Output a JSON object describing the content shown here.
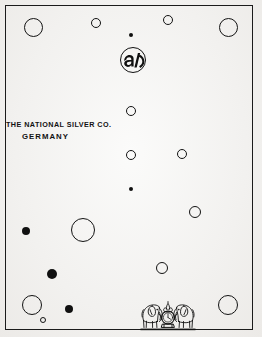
{
  "plate": {
    "background_color": "#f2f1ef",
    "ink_color": "#121212",
    "frame": {
      "stroke_color": "#1b1b1b",
      "x": 5,
      "y": 5,
      "width": 248,
      "height": 325
    }
  },
  "caption": {
    "line1": "THE NATIONAL SILVER CO.",
    "line2": "GERMANY",
    "x": 6,
    "y": 120
  },
  "monogram": {
    "label": "maker-monogram-roundel",
    "cx": 133,
    "cy": 60,
    "r": 13
  },
  "crest": {
    "label": "twin-elephants-crest",
    "x": 140,
    "y": 290,
    "width": 56,
    "height": 45
  },
  "marks": [
    {
      "id": "mark-1",
      "style": "open",
      "cx": 33,
      "cy": 27,
      "r": 9.5
    },
    {
      "id": "mark-2",
      "style": "open",
      "cx": 96,
      "cy": 23,
      "r": 5.0
    },
    {
      "id": "mark-3",
      "style": "filled",
      "cx": 131,
      "cy": 35,
      "r": 2.2
    },
    {
      "id": "mark-4",
      "style": "open",
      "cx": 168,
      "cy": 20,
      "r": 5.0
    },
    {
      "id": "mark-5",
      "style": "open",
      "cx": 228,
      "cy": 27,
      "r": 9.5
    },
    {
      "id": "mark-6",
      "style": "open",
      "cx": 131,
      "cy": 111,
      "r": 5.2
    },
    {
      "id": "mark-7",
      "style": "open",
      "cx": 131,
      "cy": 155,
      "r": 5.2
    },
    {
      "id": "mark-8",
      "style": "open",
      "cx": 182,
      "cy": 154,
      "r": 5.2
    },
    {
      "id": "mark-9",
      "style": "filled",
      "cx": 131,
      "cy": 189,
      "r": 2.2
    },
    {
      "id": "mark-10",
      "style": "open",
      "cx": 195,
      "cy": 212,
      "r": 6.0
    },
    {
      "id": "mark-11",
      "style": "filled",
      "cx": 26,
      "cy": 231,
      "r": 4.3
    },
    {
      "id": "mark-12",
      "style": "open",
      "cx": 83,
      "cy": 230,
      "r": 12.0
    },
    {
      "id": "mark-13",
      "style": "filled",
      "cx": 52,
      "cy": 274,
      "r": 5.0
    },
    {
      "id": "mark-14",
      "style": "open",
      "cx": 162,
      "cy": 268,
      "r": 6.0
    },
    {
      "id": "mark-15",
      "style": "open",
      "cx": 32,
      "cy": 305,
      "r": 10.0
    },
    {
      "id": "mark-16",
      "style": "filled",
      "cx": 69,
      "cy": 309,
      "r": 4.0
    },
    {
      "id": "mark-17",
      "style": "open",
      "cx": 43,
      "cy": 320,
      "r": 3.2
    },
    {
      "id": "mark-18",
      "style": "open",
      "cx": 228,
      "cy": 305,
      "r": 10.0
    }
  ]
}
